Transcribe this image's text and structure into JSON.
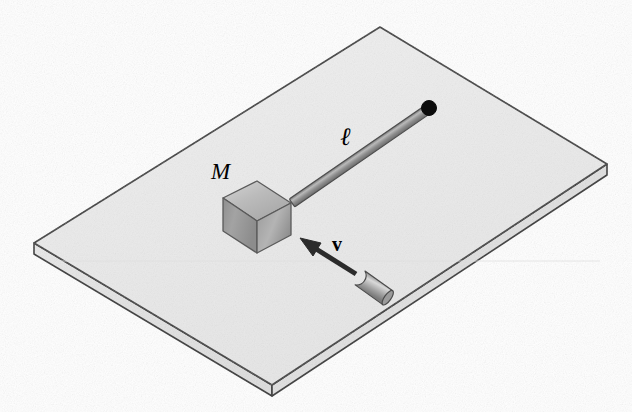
{
  "figure": {
    "kind": "physics-mechanics-diagram",
    "caption": "",
    "background_color": "#ffffff",
    "width": 632,
    "height": 412
  },
  "labels": {
    "mass_label": "M",
    "length_label": "ℓ",
    "velocity_label": "v"
  },
  "objects": {
    "table": {
      "name": "frictionless-table",
      "top_face_color": "#eeeeee",
      "edge_color": "#333333",
      "side_face_color": "#f4f4f4",
      "front_face_color": "#e2e2e2",
      "corners": {
        "left": [
          34,
          243
        ],
        "top": [
          380,
          27
        ],
        "right": [
          607,
          164
        ],
        "bottom": [
          272,
          385
        ]
      },
      "thickness": 11
    },
    "block": {
      "name": "block-of-mass-M",
      "top_face_color": "#bdbdbd",
      "left_face_color": "#9e9e9e",
      "right_face_color": "#a8a8a8",
      "outline_color": "#555555",
      "center": [
        256,
        216
      ]
    },
    "rod": {
      "name": "rigid-rod-of-length-ell",
      "color": "#8a8a8a",
      "highlight_color": "#b5b5b5",
      "outline_color": "#4a4a4a",
      "from": [
        292,
        203
      ],
      "to": [
        428,
        109
      ],
      "thickness": 9
    },
    "pivot": {
      "name": "pivot-point",
      "color": "#000000",
      "center": [
        429,
        108
      ],
      "radius": 7
    },
    "bullet": {
      "name": "incoming-bullet",
      "body_color": "#a5a5a5",
      "highlight_color": "#d8d8d8",
      "outline_color": "#4a4a4a",
      "nose": [
        359,
        276
      ],
      "tail": [
        391,
        300
      ]
    },
    "velocity_arrow": {
      "name": "velocity-vector-arrow",
      "color": "#2b2b2b",
      "tail": [
        354,
        272
      ],
      "tip": [
        301,
        239
      ],
      "head_length": 20,
      "head_width": 13
    }
  },
  "colors": {
    "ink": "#000000",
    "table_fill": "#eeeeee",
    "metal_gray": "#8a8a8a"
  }
}
